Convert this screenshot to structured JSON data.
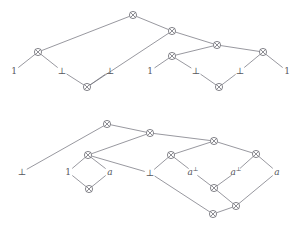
{
  "figure": {
    "background_color": "#ffffff",
    "line_color": "#6b6b75",
    "text_color": "#56565e",
    "node_glyph": "tensor-circle-cross",
    "width": 299,
    "height": 232
  },
  "diagrams": [
    {
      "id": "upper-proof-net",
      "name": "upper-proof-net",
      "nodes": [
        {
          "id": "u0",
          "label": "⊗",
          "x": 133,
          "y": 15
        },
        {
          "id": "u1",
          "label": "⊗",
          "x": 172,
          "y": 31
        },
        {
          "id": "u2",
          "label": "⊗",
          "x": 217,
          "y": 45
        },
        {
          "id": "u3",
          "label": "⊗",
          "x": 38,
          "y": 52
        },
        {
          "id": "u4",
          "label": "⊗",
          "x": 172,
          "y": 56
        },
        {
          "id": "u5",
          "label": "⊗",
          "x": 263,
          "y": 52
        },
        {
          "id": "u6",
          "label": "⊗",
          "x": 87,
          "y": 87
        },
        {
          "id": "u7",
          "label": "⊗",
          "x": 219,
          "y": 87
        }
      ],
      "leaves": [
        {
          "id": "ul0",
          "text": "1",
          "style": "plain",
          "x": 14,
          "y": 71
        },
        {
          "id": "ul1",
          "text": "⊥",
          "style": "plain",
          "x": 62,
          "y": 71
        },
        {
          "id": "ul2",
          "text": "⊥",
          "style": "plain",
          "x": 110,
          "y": 71
        },
        {
          "id": "ul3",
          "text": "1",
          "style": "plain",
          "x": 150,
          "y": 71
        },
        {
          "id": "ul4",
          "text": "⊥",
          "style": "plain",
          "x": 196,
          "y": 71
        },
        {
          "id": "ul5",
          "text": "⊥",
          "style": "plain",
          "x": 240,
          "y": 71
        },
        {
          "id": "ul6",
          "text": "1",
          "style": "plain",
          "x": 287,
          "y": 71
        }
      ],
      "edges": [
        {
          "from": "u0",
          "to": "u3"
        },
        {
          "from": "u0",
          "to": "u1"
        },
        {
          "from": "u1",
          "to": "u6"
        },
        {
          "from": "u1",
          "to": "u2"
        },
        {
          "from": "u2",
          "to": "u4"
        },
        {
          "from": "u2",
          "to": "u5"
        },
        {
          "from": "u3",
          "to": "ul0"
        },
        {
          "from": "u3",
          "to": "ul1"
        },
        {
          "from": "u6",
          "to": "ul1"
        },
        {
          "from": "u6",
          "to": "ul2"
        },
        {
          "from": "u4",
          "to": "ul3"
        },
        {
          "from": "u4",
          "to": "ul4"
        },
        {
          "from": "u7",
          "to": "ul4"
        },
        {
          "from": "u7",
          "to": "ul5"
        },
        {
          "from": "u5",
          "to": "ul5"
        },
        {
          "from": "u5",
          "to": "ul6"
        }
      ]
    },
    {
      "id": "lower-proof-net",
      "name": "lower-proof-net",
      "nodes": [
        {
          "id": "l0",
          "label": "⊗",
          "x": 107,
          "y": 124
        },
        {
          "id": "l1",
          "label": "⊗",
          "x": 150,
          "y": 133
        },
        {
          "id": "l2",
          "label": "⊗",
          "x": 214,
          "y": 141
        },
        {
          "id": "l3",
          "label": "⊗",
          "x": 88,
          "y": 155
        },
        {
          "id": "l4",
          "label": "⊗",
          "x": 171,
          "y": 155
        },
        {
          "id": "l5",
          "label": "⊗",
          "x": 256,
          "y": 154
        },
        {
          "id": "l6",
          "label": "⊗",
          "x": 89,
          "y": 189
        },
        {
          "id": "l7",
          "label": "⊗",
          "x": 214,
          "y": 188
        },
        {
          "id": "l8",
          "label": "⊗",
          "x": 236,
          "y": 206
        },
        {
          "id": "l9",
          "label": "⊗",
          "x": 213,
          "y": 214
        }
      ],
      "leaves": [
        {
          "id": "ll0",
          "text": "⊥",
          "style": "plain",
          "x": 22,
          "y": 172
        },
        {
          "id": "ll1",
          "text": "1",
          "style": "plain",
          "x": 68,
          "y": 172
        },
        {
          "id": "ll2",
          "text": "a",
          "style": "italic",
          "x": 110,
          "y": 172
        },
        {
          "id": "ll3",
          "text": "⊥",
          "style": "plain",
          "x": 150,
          "y": 173
        },
        {
          "id": "ll4",
          "text": "a",
          "style": "italic-perp",
          "sup": "⊥",
          "x": 193,
          "y": 172
        },
        {
          "id": "ll5",
          "text": "a",
          "style": "italic-perp",
          "sup": "⊥",
          "x": 236,
          "y": 172
        },
        {
          "id": "ll6",
          "text": "a",
          "style": "italic",
          "x": 277,
          "y": 172
        }
      ],
      "edges": [
        {
          "from": "l0",
          "to": "ll0"
        },
        {
          "from": "l0",
          "to": "l1"
        },
        {
          "from": "l1",
          "to": "l3"
        },
        {
          "from": "l1",
          "to": "l2"
        },
        {
          "from": "l2",
          "to": "l4"
        },
        {
          "from": "l2",
          "to": "l5"
        },
        {
          "from": "l3",
          "to": "ll1"
        },
        {
          "from": "l3",
          "to": "ll2"
        },
        {
          "from": "l3",
          "to": "ll3"
        },
        {
          "from": "l6",
          "to": "ll1"
        },
        {
          "from": "l6",
          "to": "ll2"
        },
        {
          "from": "l4",
          "to": "ll3"
        },
        {
          "from": "l4",
          "to": "ll4"
        },
        {
          "from": "l7",
          "to": "ll4"
        },
        {
          "from": "l7",
          "to": "ll5"
        },
        {
          "from": "l5",
          "to": "ll5"
        },
        {
          "from": "l5",
          "to": "ll6"
        },
        {
          "from": "l9",
          "to": "ll3"
        },
        {
          "from": "l9",
          "to": "l8"
        },
        {
          "from": "l8",
          "to": "l7"
        },
        {
          "from": "l8",
          "to": "ll6"
        }
      ]
    }
  ]
}
